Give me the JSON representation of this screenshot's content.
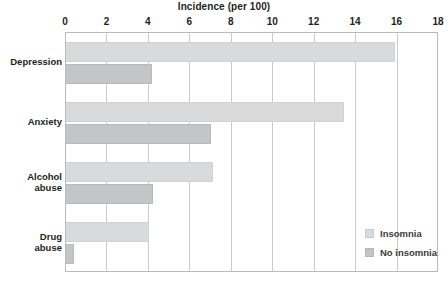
{
  "chart_data": {
    "type": "bar",
    "orientation": "horizontal",
    "title": "Incidence (per 100)",
    "xlabel": "",
    "ylabel": "",
    "xlim": [
      0,
      18
    ],
    "xticks": [
      0,
      2,
      4,
      6,
      8,
      10,
      12,
      14,
      16,
      18
    ],
    "xtick_labels": [
      "0",
      "2",
      "4",
      "6",
      "8",
      "10",
      "12",
      "14",
      "16",
      "18"
    ],
    "grid": "vertical",
    "legend_position": "inside-center-right",
    "categories": [
      "Depression",
      "Anxiety",
      "Alcohol\nabuse",
      "Drug\nabuse"
    ],
    "series": [
      {
        "name": "Insomnia",
        "color": "#d9dadb",
        "values": [
          15.9,
          13.4,
          7.1,
          4.0
        ]
      },
      {
        "name": "No insomnia",
        "color": "#c3c6c8",
        "values": [
          4.15,
          7.0,
          4.2,
          0.4
        ]
      }
    ]
  }
}
